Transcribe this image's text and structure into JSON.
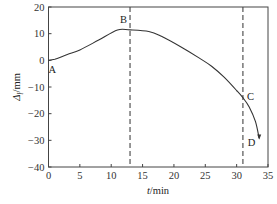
{
  "chart_data": {
    "type": "line",
    "title": "",
    "xlabel": "t/min",
    "ylabel": "Δl/mm",
    "xlim": [
      0,
      35
    ],
    "ylim": [
      -40,
      20
    ],
    "xticks": [
      0,
      5,
      10,
      15,
      20,
      25,
      30,
      35
    ],
    "yticks": [
      20,
      10,
      0,
      -10,
      -20,
      -30,
      -40
    ],
    "grid": false,
    "legend": null,
    "series": [
      {
        "name": "displacement",
        "x": [
          0,
          1,
          3,
          5,
          8,
          11,
          13,
          16,
          18,
          21,
          24,
          26,
          28,
          30,
          31,
          32,
          33,
          33.6
        ],
        "y": [
          0,
          0.4,
          2.2,
          3.9,
          7.6,
          11.4,
          11.4,
          10.8,
          9.0,
          5.2,
          0.9,
          -2.2,
          -6.3,
          -11.3,
          -14.0,
          -17.5,
          -23.0,
          -29.3
        ]
      }
    ],
    "vertical_lines": [
      {
        "x": 13,
        "style": "dashed"
      },
      {
        "x": 31,
        "style": "dashed"
      }
    ],
    "annotations": [
      {
        "text": "A",
        "x": 0,
        "y": 0
      },
      {
        "text": "B",
        "x": 13,
        "y": 11.4
      },
      {
        "text": "C",
        "x": 31,
        "y": -14.0
      },
      {
        "text": "D",
        "x": 33.6,
        "y": -29.3
      }
    ]
  },
  "labels": {
    "x_axis": "t/min",
    "x_axis_italic": "t",
    "x_axis_unit": "/min",
    "y_axis_sym": "Δ",
    "y_axis_sub": "l",
    "y_axis_unit": "/mm",
    "point_a": "A",
    "point_b": "B",
    "point_c": "C",
    "point_d": "D"
  }
}
